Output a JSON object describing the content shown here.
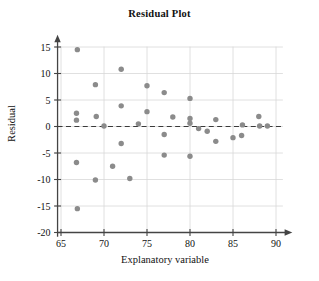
{
  "chart_data": {
    "type": "scatter",
    "title": "Residual Plot",
    "xlabel": "Explanatory variable",
    "ylabel": "Residual",
    "xlim": [
      64.0,
      91.0
    ],
    "ylim": [
      -20,
      17
    ],
    "xticks": [
      65,
      70,
      75,
      80,
      85,
      90
    ],
    "yticks": [
      -20,
      -15,
      -10,
      -5,
      0,
      5,
      10,
      15
    ],
    "xtick_labels": [
      "65",
      "70",
      "75",
      "80",
      "85",
      "90"
    ],
    "ytick_labels": [
      "-20",
      "-15",
      "-10",
      "-5",
      "0",
      "5",
      "10",
      "15"
    ],
    "grid": true,
    "grid_color": "#d8d8d8",
    "legend": null,
    "reference_line": {
      "name": "zero-residual-line",
      "y": 0,
      "style": "dashed",
      "color": "#3a3a3a"
    },
    "marker": {
      "shape": "circle",
      "radius": 2.7,
      "color": "#8b8b8b"
    },
    "points": [
      {
        "x": 66.9,
        "y": 14.5
      },
      {
        "x": 66.8,
        "y": 2.5
      },
      {
        "x": 66.8,
        "y": 1.2
      },
      {
        "x": 66.8,
        "y": -6.8
      },
      {
        "x": 66.9,
        "y": -15.5
      },
      {
        "x": 69.0,
        "y": 7.9
      },
      {
        "x": 69.1,
        "y": 1.9
      },
      {
        "x": 69.0,
        "y": -10.1
      },
      {
        "x": 70.0,
        "y": 0.1
      },
      {
        "x": 71.0,
        "y": -7.5
      },
      {
        "x": 72.0,
        "y": 10.8
      },
      {
        "x": 72.0,
        "y": 3.9
      },
      {
        "x": 72.0,
        "y": -3.2
      },
      {
        "x": 73.0,
        "y": -9.8
      },
      {
        "x": 74.0,
        "y": 0.5
      },
      {
        "x": 75.0,
        "y": 7.7
      },
      {
        "x": 75.0,
        "y": 2.8
      },
      {
        "x": 77.0,
        "y": 6.4
      },
      {
        "x": 77.0,
        "y": -1.5
      },
      {
        "x": 77.0,
        "y": -5.4
      },
      {
        "x": 78.0,
        "y": 1.8
      },
      {
        "x": 80.0,
        "y": 5.3
      },
      {
        "x": 80.0,
        "y": 1.5
      },
      {
        "x": 80.0,
        "y": 0.6
      },
      {
        "x": 80.0,
        "y": -5.6
      },
      {
        "x": 81.0,
        "y": -0.4
      },
      {
        "x": 82.0,
        "y": -0.9
      },
      {
        "x": 83.0,
        "y": 1.3
      },
      {
        "x": 83.0,
        "y": -2.8
      },
      {
        "x": 85.0,
        "y": -2.1
      },
      {
        "x": 86.0,
        "y": -1.7
      },
      {
        "x": 86.1,
        "y": 0.3
      },
      {
        "x": 88.0,
        "y": 1.9
      },
      {
        "x": 88.1,
        "y": 0.1
      },
      {
        "x": 89.0,
        "y": 0.1
      }
    ]
  }
}
